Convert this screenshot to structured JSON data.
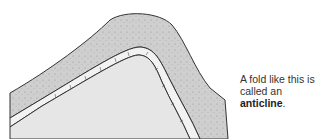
{
  "caption": {
    "text_before": "A fold like this is called an ",
    "term": "anticline",
    "text_after": "."
  },
  "diagram": {
    "layers": [
      "upper-rock-layer",
      "thin-bedded-layer",
      "core-rock"
    ],
    "colors": {
      "upper_layer": "#cfcfcf",
      "thin_layer": "#f2f2f2",
      "core": "#e4e4e4",
      "outline": "#333333"
    }
  }
}
